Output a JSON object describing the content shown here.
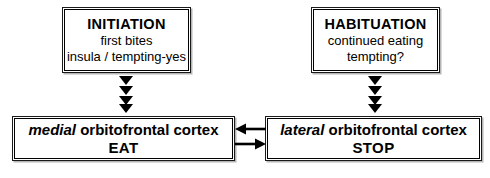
{
  "diagram": {
    "colors": {
      "stroke": "#000000",
      "background": "#ffffff",
      "shadow": "#787878"
    },
    "nodes": {
      "initiation": {
        "heading": "INITIATION",
        "line2": "first bites",
        "line3": "insula / tempting-yes"
      },
      "habituation": {
        "heading": "HABITUATION",
        "line2": "continued eating",
        "line3": "tempting?"
      },
      "medial": {
        "region_emphasis": "medial",
        "region_rest": " orbitofrontal cortex",
        "action": "EAT"
      },
      "lateral": {
        "region_emphasis": "lateral",
        "region_rest": " orbitofrontal cortex",
        "action": "STOP"
      }
    },
    "connectors": {
      "initiation_to_medial": "triangle-arrow-down-stack",
      "habituation_to_lateral": "triangle-arrow-down-stack",
      "lateral_to_medial": "arrow-left",
      "medial_to_lateral": "arrow-right"
    }
  }
}
